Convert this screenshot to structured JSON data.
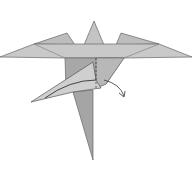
{
  "diagram": {
    "colors": {
      "background": "#ffffff",
      "paper_light": "#c9c9c9",
      "paper_mid": "#b4b4b4",
      "paper_dark": "#9c9c9c",
      "stroke": "#555555"
    },
    "annotations": {
      "fold_line": "dashed-valley-fold",
      "arrow": "fold-behind-arrow"
    }
  }
}
